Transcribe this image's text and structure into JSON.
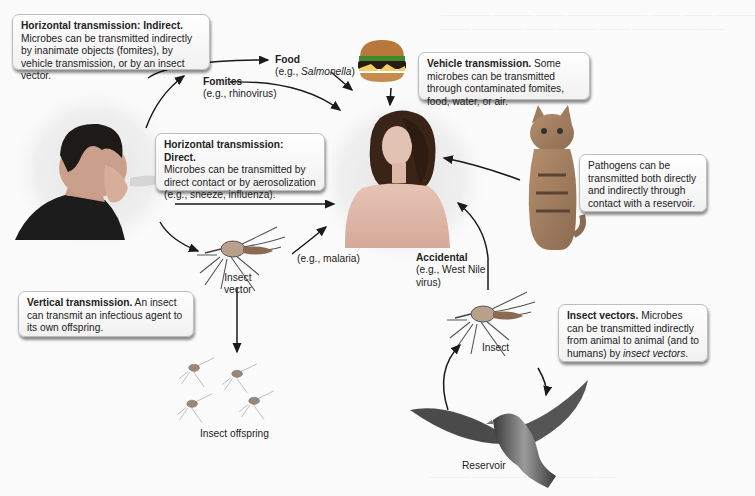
{
  "diagram": {
    "boxes": {
      "indirect": {
        "heading": "Horizontal transmission: Indirect.",
        "body": "Microbes can be transmitted indirectly by inanimate objects (fomites), by vehicle transmission, or by an insect vector."
      },
      "vehicle": {
        "heading": "Vehicle transmission.",
        "body": " Some microbes can be transmitted through contaminated fomites, food, water, or air."
      },
      "direct": {
        "heading": "Horizontal transmission: Direct.",
        "body": "Microbes can be transmitted by direct contact or by aerosolization (e.g., sneeze, influenza)."
      },
      "reservoir": {
        "body": "Pathogens can be transmitted both directly and indirectly through contact with a reservoir."
      },
      "vertical": {
        "heading": "Vertical transmission.",
        "body": " An insect can transmit an infectious agent to its own offspring."
      },
      "insect_vectors": {
        "heading": "Insect vectors.",
        "body_pre": " Microbes can be transmitted indirectly from animal to animal (and to humans) by ",
        "body_italic": "insect vectors",
        "body_post": "."
      }
    },
    "labels": {
      "food_title": "Food",
      "food_example_pre": "(e.g., ",
      "food_example_italic": "Salmonella",
      "food_example_post": ")",
      "fomites_title": "Fomites",
      "fomites_example": "(e.g., rhinovirus)",
      "malaria_example": "(e.g., malaria)",
      "insect_vector_line1": "Insect",
      "insect_vector_line2": "vector",
      "accidental_title": "Accidental",
      "accidental_example_line1": "(e.g., West Nile",
      "accidental_example_line2": "virus)",
      "insect": "Insect",
      "insect_offspring": "Insect offspring",
      "reservoir": "Reservoir"
    },
    "figures": {
      "sneezing_man": "sneezing-man-photo",
      "woman": "woman-photo",
      "hamburger": "hamburger-photo",
      "cat": "cat-photo",
      "mosquito": "mosquito-illustration",
      "bird": "bird-illustration"
    },
    "colors": {
      "arrow": "#1a1a1a",
      "box_border": "#bdbdbd",
      "background": "#fbfbfb"
    }
  }
}
